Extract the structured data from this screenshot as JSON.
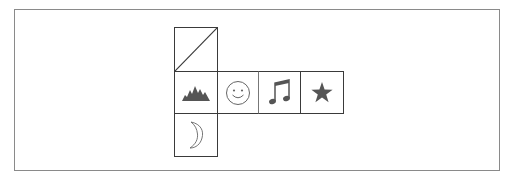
{
  "diagram": {
    "type": "cube-net",
    "colors": {
      "stroke": "#3a3a3a",
      "frame": "#8a8a8a",
      "icon_fill": "#555555",
      "icon_outline": "#666666"
    },
    "faces": [
      {
        "id": "top",
        "icon": "diagonal-line-icon",
        "row": 0,
        "col": 0
      },
      {
        "id": "left",
        "icon": "mountains-icon",
        "row": 1,
        "col": 0
      },
      {
        "id": "front",
        "icon": "smiley-face-icon",
        "row": 1,
        "col": 1
      },
      {
        "id": "right",
        "icon": "music-note-icon",
        "row": 1,
        "col": 2
      },
      {
        "id": "back",
        "icon": "star-icon",
        "row": 1,
        "col": 3
      },
      {
        "id": "bottom",
        "icon": "crescent-moon-icon",
        "row": 2,
        "col": 0
      }
    ]
  }
}
